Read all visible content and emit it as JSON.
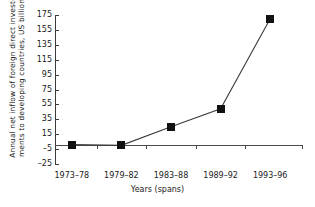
{
  "chart_data": {
    "type": "line",
    "title": "",
    "subtitle": "",
    "xlabel": "Years (spans)",
    "ylabel": "Annual net inflow of foreign direct invest-ments to developing countries, US billion",
    "ylabel_lines": [
      "Annual net inflow of foreign direct invest-",
      "ments to developing countries, US billion"
    ],
    "categories": [
      "1973–78",
      "1979–82",
      "1983–88",
      "1989–92",
      "1993–96"
    ],
    "values": [
      1,
      0,
      25,
      49,
      170
    ],
    "ylim": [
      -25,
      175
    ],
    "yticks": [
      175,
      155,
      135,
      115,
      95,
      75,
      55,
      35,
      15,
      -5,
      -25
    ],
    "ytick_labels": [
      "175",
      "155",
      "135",
      "115",
      "95",
      "75",
      "55",
      "35",
      "15",
      "–5",
      "–25"
    ],
    "grid": false,
    "legend": false,
    "legend_position": "none",
    "marker": "square",
    "marker_color": "#111111",
    "line_color": "#3b3b3b",
    "axis_color": "#3b3b3b",
    "background": "#ffffff"
  }
}
